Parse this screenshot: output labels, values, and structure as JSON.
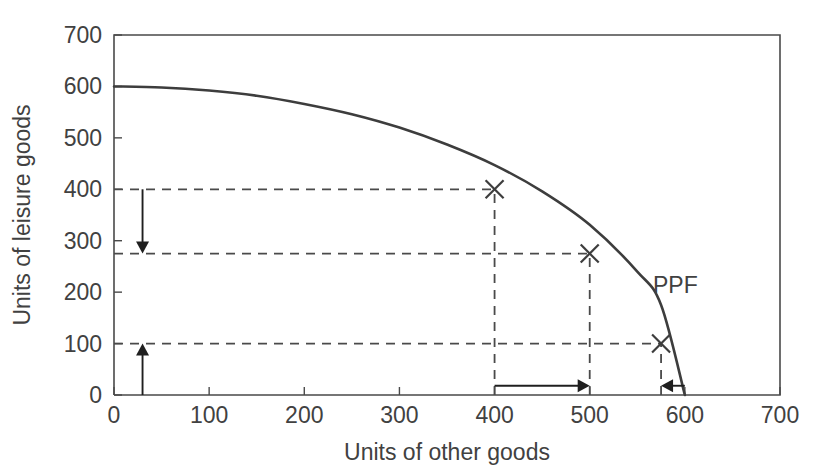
{
  "chart_data": {
    "type": "line",
    "title": "",
    "xlabel": "Units of other goods",
    "ylabel": "Units of leisure goods",
    "xlim": [
      0,
      700
    ],
    "ylim": [
      0,
      700
    ],
    "xticks": [
      0,
      100,
      200,
      300,
      400,
      500,
      600,
      700
    ],
    "yticks": [
      0,
      100,
      200,
      300,
      400,
      500,
      600,
      700
    ],
    "xtick_labels": [
      "0",
      "100",
      "200",
      "300",
      "400",
      "500",
      "600",
      "700"
    ],
    "ytick_labels": [
      "0",
      "100",
      "200",
      "300",
      "400",
      "500",
      "600",
      "700"
    ],
    "grid": false,
    "legend_position": "none",
    "series": [
      {
        "name": "PPF",
        "label": "PPF",
        "type": "curve",
        "description": "Production possibility frontier, concave to origin, from (0,600) to (600,0)",
        "x_intercept": 600,
        "y_intercept": 600,
        "x": [
          0,
          50,
          100,
          150,
          200,
          250,
          300,
          350,
          400,
          450,
          500,
          550,
          575,
          600
        ],
        "y": [
          600,
          598,
          592,
          582,
          566,
          546,
          520,
          487,
          447,
          396,
          331,
          240,
          175,
          0
        ]
      }
    ],
    "points": [
      {
        "name": "point-a",
        "x": 400,
        "y": 400,
        "marker": "x"
      },
      {
        "name": "point-b",
        "x": 500,
        "y": 275,
        "marker": "x"
      },
      {
        "name": "point-c",
        "x": 575,
        "y": 100,
        "marker": "x"
      }
    ],
    "guide_lines": [
      {
        "name": "hline-400",
        "orientation": "horizontal",
        "value": 400,
        "from": 0,
        "to": 400,
        "style": "dashed"
      },
      {
        "name": "hline-275",
        "orientation": "horizontal",
        "value": 275,
        "from": 0,
        "to": 500,
        "style": "dashed"
      },
      {
        "name": "hline-100",
        "orientation": "horizontal",
        "value": 100,
        "from": 0,
        "to": 575,
        "style": "dashed"
      },
      {
        "name": "vline-400",
        "orientation": "vertical",
        "value": 400,
        "from": 0,
        "to": 400,
        "style": "dashed"
      },
      {
        "name": "vline-500",
        "orientation": "vertical",
        "value": 500,
        "from": 0,
        "to": 275,
        "style": "dashed"
      },
      {
        "name": "vline-575",
        "orientation": "vertical",
        "value": 575,
        "from": 0,
        "to": 100,
        "style": "dashed"
      }
    ],
    "annotations": [
      {
        "name": "arrow-down-leisure",
        "type": "arrow",
        "direction": "down",
        "x": 30,
        "y_from": 400,
        "y_to": 275
      },
      {
        "name": "arrow-up-leisure",
        "type": "arrow",
        "direction": "up",
        "x": 30,
        "y_from": 0,
        "y_to": 100
      },
      {
        "name": "arrow-right-other-goods",
        "type": "arrow",
        "direction": "right",
        "y": 18,
        "x_from": 400,
        "x_to": 500
      },
      {
        "name": "arrow-left-other-goods",
        "type": "arrow",
        "direction": "left",
        "y": 18,
        "x_from": 600,
        "x_to": 575
      },
      {
        "name": "ppf-label",
        "type": "text",
        "text": "PPF",
        "x": 620,
        "y": 230
      }
    ],
    "colors": {
      "curve": "#3d3d3d",
      "axis": "#4a4a4a",
      "dashed_guide": "#4a4a4a",
      "annotation": "#1f1f1f",
      "text": "#414141",
      "background": "#ffffff"
    }
  }
}
